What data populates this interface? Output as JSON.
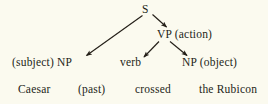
{
  "diagram": {
    "type": "syntax-tree",
    "background_color": "#fbfaef",
    "ink_color": "#241f18",
    "root": {
      "label": "S"
    },
    "nodes": [
      {
        "id": "vp",
        "label": "VP (action)"
      },
      {
        "id": "np_subject",
        "label": "(subject) NP"
      },
      {
        "id": "verb",
        "label": "verb"
      },
      {
        "id": "np_object",
        "label": "NP (object)"
      }
    ],
    "words": [
      {
        "id": "word_caesar",
        "label": "Caesar"
      },
      {
        "id": "word_past",
        "label": "(past)"
      },
      {
        "id": "word_crossed",
        "label": "crossed"
      },
      {
        "id": "word_the_rubicon",
        "label": "the Rubicon"
      }
    ],
    "edges": [
      {
        "id": "edge-s-np-subject",
        "from": "S",
        "to": "(subject) NP"
      },
      {
        "id": "edge-s-vp",
        "from": "S",
        "to": "VP (action)"
      },
      {
        "id": "edge-vp-verb",
        "from": "VP (action)",
        "to": "verb"
      },
      {
        "id": "edge-vp-np-object",
        "from": "VP (action)",
        "to": "NP (object)"
      }
    ]
  }
}
